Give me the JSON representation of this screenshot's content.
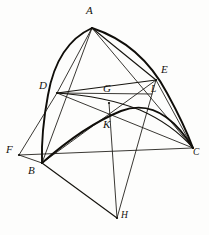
{
  "figure": {
    "background_color": "#fdfdfc",
    "ink_color": "#16140f",
    "width": 209,
    "height": 235
  },
  "labels": {
    "A": "A",
    "B": "B",
    "C": "C",
    "D": "D",
    "E": "E",
    "F": "F",
    "G": "G",
    "H": "H",
    "K": "K",
    "L": "L"
  },
  "points": [
    {
      "name": "A",
      "label": "A",
      "x": 92,
      "y": 28,
      "label_x": 88,
      "label_y": 8
    },
    {
      "name": "D",
      "label": "D",
      "x": 57,
      "y": 93,
      "label_x": 41,
      "label_y": 83
    },
    {
      "name": "E",
      "label": "E",
      "x": 156,
      "y": 80,
      "label_x": 161,
      "label_y": 68
    },
    {
      "name": "G",
      "label": "G",
      "x": 109,
      "y": 103,
      "label_x": 103,
      "label_y": 86
    },
    {
      "name": "L",
      "label": "L",
      "x": 152,
      "y": 94,
      "label_x": 152,
      "label_y": 85
    },
    {
      "name": "K",
      "label": "K",
      "x": 110,
      "y": 118,
      "label_x": 103,
      "label_y": 120
    },
    {
      "name": "F",
      "label": "F",
      "x": 19,
      "y": 155,
      "label_x": 8,
      "label_y": 145
    },
    {
      "name": "B",
      "label": "B",
      "x": 42,
      "y": 163,
      "label_x": 29,
      "label_y": 166
    },
    {
      "name": "C",
      "label": "C",
      "x": 193,
      "y": 148,
      "label_x": 193,
      "label_y": 148
    },
    {
      "name": "H",
      "label": "H",
      "x": 117,
      "y": 218,
      "label_x": 121,
      "label_y": 211
    }
  ],
  "segments": [
    {
      "name": "arc-A-D-B",
      "kind": "arc",
      "from": "A",
      "to": "B",
      "weight": "bold"
    },
    {
      "name": "arc-A-E-C",
      "kind": "arc",
      "from": "A",
      "to": "C",
      "weight": "bold"
    },
    {
      "name": "arc-B-K-C",
      "kind": "arc",
      "from": "B",
      "to": "C",
      "weight": "bold"
    },
    {
      "name": "arc-D-G-C",
      "kind": "arc",
      "from": "D",
      "to": "C",
      "weight": "med"
    },
    {
      "name": "chord-A-B",
      "kind": "straight",
      "from": "A",
      "to": "B",
      "weight": "thin"
    },
    {
      "name": "chord-A-C",
      "kind": "straight",
      "from": "A",
      "to": "C",
      "weight": "thin"
    },
    {
      "name": "chord-A-D",
      "kind": "straight",
      "from": "A",
      "to": "D",
      "weight": "thin"
    },
    {
      "name": "chord-A-E",
      "kind": "straight",
      "from": "A",
      "to": "E",
      "weight": "med"
    },
    {
      "name": "chord-D-E",
      "kind": "straight",
      "from": "D",
      "to": "E",
      "weight": "med"
    },
    {
      "name": "chord-D-C",
      "kind": "straight",
      "from": "D",
      "to": "C",
      "weight": "thin"
    },
    {
      "name": "chord-F-C",
      "kind": "straight",
      "from": "F",
      "to": "C",
      "weight": "thin"
    },
    {
      "name": "chord-F-D",
      "kind": "straight",
      "from": "F",
      "to": "D",
      "weight": "thin"
    },
    {
      "name": "chord-F-B",
      "kind": "straight",
      "from": "F",
      "to": "B",
      "weight": "thin"
    },
    {
      "name": "chord-B-E",
      "kind": "straight",
      "from": "B",
      "to": "E",
      "weight": "thin"
    },
    {
      "name": "chord-B-H",
      "kind": "straight",
      "from": "B",
      "to": "H",
      "weight": "med"
    },
    {
      "name": "chord-E-C",
      "kind": "straight",
      "from": "E",
      "to": "C",
      "weight": "thin"
    },
    {
      "name": "chord-G-H",
      "kind": "straight",
      "from": "G",
      "to": "H",
      "weight": "thin"
    },
    {
      "name": "chord-E-H",
      "kind": "straight",
      "from": "E",
      "to": "H",
      "weight": "thin"
    },
    {
      "name": "chord-D-K",
      "kind": "straight",
      "from": "D",
      "to": "K",
      "weight": "thin"
    }
  ]
}
